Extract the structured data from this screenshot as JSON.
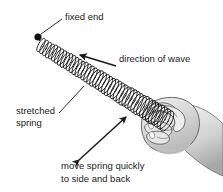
{
  "figure": {
    "background_color": "#ffffff",
    "line_color": "#1a1a1a",
    "hand_fill_color": "#d8d8d8",
    "hand_outline_color": "#555555",
    "labels": {
      "fixed_end": "fixed end",
      "direction_of_wave": "direction of wave",
      "stretched_spring_line1": "stretched",
      "stretched_spring_line2": "spring",
      "move_spring_line1": "move spring quickly",
      "move_spring_line2": "to side and back"
    },
    "annotations": {
      "fixed_end_marker": "black-dot",
      "wave_arrow_direction": "up-left",
      "motion_arrow_direction": "double-headed-diagonal",
      "spring_coil_count": 44
    }
  }
}
